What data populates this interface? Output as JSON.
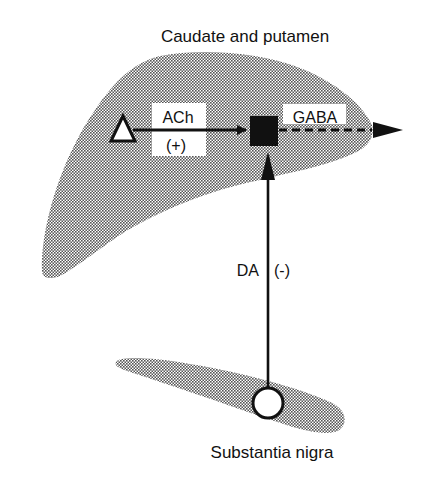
{
  "diagram": {
    "regions": {
      "striatum": {
        "label": "Caudate and putamen"
      },
      "nigra": {
        "label": "Substantia nigra"
      }
    },
    "pathways": {
      "cholinergic": {
        "transmitter": "ACh",
        "effect": "(+)"
      },
      "gabaergic": {
        "transmitter": "GABA"
      },
      "dopaminergic": {
        "transmitter": "DA",
        "effect": "(-)"
      }
    },
    "nodes": {
      "cholinergic_neuron": {
        "shape": "triangle"
      },
      "gabaergic_neuron": {
        "shape": "square"
      },
      "dopaminergic_neuron": {
        "shape": "circle"
      }
    },
    "colors": {
      "shading": "#b5b5b5",
      "line": "#111111",
      "background": "#ffffff"
    }
  }
}
